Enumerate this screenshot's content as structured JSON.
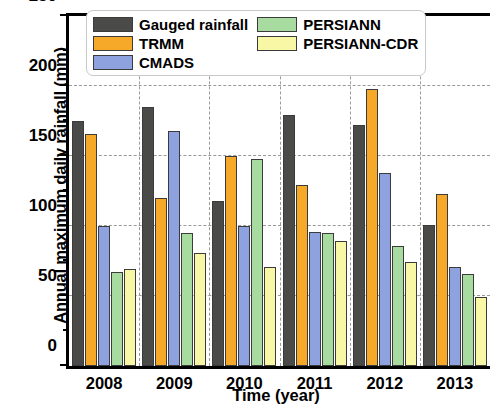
{
  "chart_data": {
    "type": "bar",
    "title": "",
    "xlabel": "Time (year)",
    "ylabel": "Annual maximum daily rainfall (mm)",
    "categories": [
      "2008",
      "2009",
      "2010",
      "2011",
      "2012",
      "2013"
    ],
    "ylim": [
      0,
      250
    ],
    "yticks": [
      0,
      50,
      100,
      150,
      200,
      250
    ],
    "ytick_labels": [
      "0",
      "50",
      "100",
      "150",
      "200",
      "250"
    ],
    "yminorticks": [
      25,
      75,
      125,
      175,
      225
    ],
    "grid": "horizontal-and-vertical-dashed",
    "legend_position": "top-center-inside",
    "series": [
      {
        "name": "Gauged rainfall",
        "color": "#4a4a48",
        "values": [
          175,
          185,
          118,
          179,
          172,
          101
        ]
      },
      {
        "name": "TRMM",
        "color": "#f6a929",
        "values": [
          166,
          120,
          150,
          129,
          198,
          123
        ]
      },
      {
        "name": "CMADS",
        "color": "#8fa2e0",
        "values": [
          100,
          168,
          100,
          96,
          138,
          71
        ]
      },
      {
        "name": "PERSIANN",
        "color": "#a8dba0",
        "values": [
          67,
          95,
          148,
          95,
          86,
          66
        ]
      },
      {
        "name": "PERSIANN-CDR",
        "color": "#f7f7a6",
        "values": [
          69,
          81,
          71,
          89,
          74,
          49
        ]
      }
    ]
  }
}
